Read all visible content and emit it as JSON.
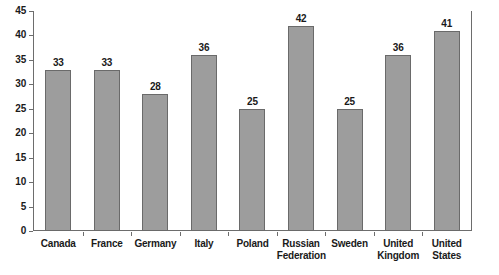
{
  "chart_data": {
    "type": "bar",
    "title": "",
    "subtitle": "",
    "xlabel": "",
    "ylabel": "",
    "ylim": [
      0,
      45
    ],
    "yticks": [
      0,
      5,
      10,
      15,
      20,
      25,
      30,
      35,
      40,
      45
    ],
    "ytick_labels": [
      "0",
      "5",
      "10",
      "15",
      "20",
      "25",
      "30",
      "35",
      "40",
      "45"
    ],
    "grid": false,
    "legend": false,
    "legend_position": "none",
    "bar_color": "#9d9d9d",
    "bar_edge_color": "#6a6a6a",
    "axis_color": "#6d6d6d",
    "categories": [
      "Canada",
      "France",
      "Germany",
      "Italy",
      "Poland",
      "Russian Federation",
      "Sweden",
      "United Kingdom",
      "United States"
    ],
    "category_lines": [
      [
        "Canada"
      ],
      [
        "France"
      ],
      [
        "Germany"
      ],
      [
        "Italy"
      ],
      [
        "Poland"
      ],
      [
        "Russian",
        "Federation"
      ],
      [
        "Sweden"
      ],
      [
        "United",
        "Kingdom"
      ],
      [
        "United",
        "States"
      ]
    ],
    "values": [
      33,
      33,
      28,
      36,
      25,
      42,
      25,
      36,
      41
    ],
    "value_labels": [
      "33",
      "33",
      "28",
      "36",
      "25",
      "42",
      "25",
      "36",
      "41"
    ]
  }
}
